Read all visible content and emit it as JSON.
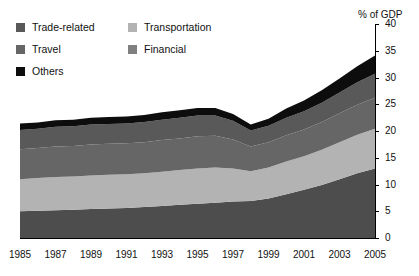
{
  "chart_data": {
    "type": "area",
    "stacked": true,
    "title": "",
    "subtitle": "",
    "xlabel": "",
    "ylabel": "% of GDP",
    "ylim": [
      0,
      40
    ],
    "ytick_step": 5,
    "yticks": [
      "0",
      "5",
      "10",
      "15",
      "20",
      "25",
      "30",
      "35",
      "40"
    ],
    "xlim": [
      1985,
      2005
    ],
    "x": [
      1985,
      1986,
      1987,
      1988,
      1989,
      1990,
      1991,
      1992,
      1993,
      1994,
      1995,
      1996,
      1997,
      1998,
      1999,
      2000,
      2001,
      2002,
      2003,
      2004,
      2005
    ],
    "xticks": [
      "1985",
      "1987",
      "1989",
      "1991",
      "1993",
      "1995",
      "1997",
      "1999",
      "2001",
      "2003",
      "2005"
    ],
    "grid": false,
    "legend_position": "top-left",
    "stack_order_bottom_to_top": [
      "Financial",
      "Transportation",
      "Travel",
      "Trade-related",
      "Others"
    ],
    "series": [
      {
        "name": "Financial",
        "color": "#4d4d4d",
        "values": [
          5.0,
          5.1,
          5.2,
          5.3,
          5.4,
          5.5,
          5.6,
          5.8,
          6.0,
          6.2,
          6.4,
          6.6,
          6.8,
          6.9,
          7.4,
          8.2,
          9.0,
          9.9,
          11.0,
          12.1,
          13.0
        ]
      },
      {
        "name": "Transportation",
        "color": "#b3b3b3",
        "values": [
          6.0,
          6.1,
          6.2,
          6.2,
          6.3,
          6.3,
          6.3,
          6.3,
          6.4,
          6.5,
          6.6,
          6.6,
          6.2,
          5.6,
          5.8,
          6.1,
          6.3,
          6.6,
          6.9,
          7.2,
          7.4
        ]
      },
      {
        "name": "Travel",
        "color": "#666666",
        "values": [
          5.6,
          5.6,
          5.7,
          5.7,
          5.8,
          5.8,
          5.8,
          5.8,
          5.9,
          5.9,
          6.0,
          5.9,
          5.4,
          4.6,
          4.7,
          4.9,
          5.0,
          5.2,
          5.4,
          5.6,
          5.8
        ]
      },
      {
        "name": "Trade-related",
        "color": "#595959",
        "values": [
          3.6,
          3.6,
          3.7,
          3.7,
          3.7,
          3.7,
          3.7,
          3.8,
          3.8,
          3.9,
          3.9,
          3.8,
          3.5,
          3.0,
          3.1,
          3.3,
          3.4,
          3.6,
          3.9,
          4.2,
          4.5
        ]
      },
      {
        "name": "Others",
        "color": "#0d0d0d",
        "values": [
          1.2,
          1.2,
          1.2,
          1.2,
          1.3,
          1.3,
          1.3,
          1.3,
          1.4,
          1.4,
          1.4,
          1.4,
          1.3,
          1.1,
          1.3,
          1.7,
          2.0,
          2.3,
          2.6,
          3.0,
          3.4
        ]
      }
    ],
    "totals": [
      21.4,
      21.6,
      22.0,
      22.1,
      22.5,
      22.6,
      22.7,
      23.0,
      23.5,
      23.9,
      24.3,
      24.3,
      23.2,
      21.2,
      22.3,
      24.2,
      25.7,
      27.6,
      29.8,
      32.1,
      34.1
    ]
  },
  "legend": {
    "rows": [
      [
        {
          "label": "Trade-related",
          "color": "#595959",
          "swatch_name": "legend-swatch-trade-related"
        },
        {
          "label": "Transportation",
          "color": "#b3b3b3",
          "swatch_name": "legend-swatch-transportation"
        }
      ],
      [
        {
          "label": "Travel",
          "color": "#666666",
          "swatch_name": "legend-swatch-travel"
        },
        {
          "label": "Financial",
          "color": "#808080",
          "swatch_name": "legend-swatch-financial"
        }
      ],
      [
        {
          "label": "Others",
          "color": "#0d0d0d",
          "swatch_name": "legend-swatch-others"
        }
      ]
    ]
  },
  "axis": {
    "y_title": "% of GDP"
  }
}
